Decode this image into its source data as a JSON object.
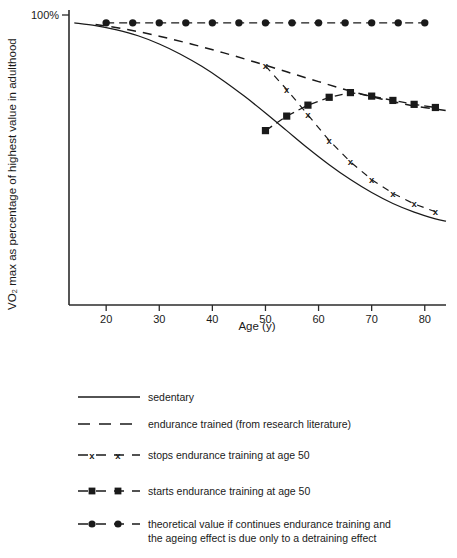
{
  "chart_data": {
    "type": "line",
    "title": "",
    "xlabel": "Age (y)",
    "ylabel": "VO₂ max as percentage of highest value in adulthood",
    "y_top_label": "100%",
    "xlim": [
      13,
      84
    ],
    "ylim": [
      28,
      102
    ],
    "grid": false,
    "legend_position": "below-plot",
    "x_ticks": [
      "20",
      "30",
      "40",
      "50",
      "60",
      "70",
      "80"
    ],
    "x_tick_values": [
      20,
      30,
      40,
      50,
      60,
      70,
      80
    ],
    "y_ticks": [
      "100%"
    ],
    "y_tick_values": [
      100
    ],
    "series": [
      {
        "name": "sedentary",
        "style": "solid",
        "marker": "none",
        "x": [
          14,
          18,
          22,
          26,
          30,
          34,
          38,
          42,
          46,
          50,
          54,
          58,
          62,
          66,
          70,
          74,
          78,
          82,
          84
        ],
        "values": [
          100,
          99.3,
          98.2,
          96.7,
          94.6,
          92.0,
          88.9,
          85.3,
          81.3,
          77.0,
          72.5,
          68.0,
          63.8,
          60.0,
          56.7,
          53.9,
          51.7,
          50.0,
          49.4
        ]
      },
      {
        "name": "endurance trained (from research literature)",
        "style": "dashed",
        "marker": "none",
        "x": [
          18,
          24,
          30,
          36,
          42,
          48,
          54,
          60,
          66,
          72,
          78,
          84
        ],
        "values": [
          99.6,
          98.3,
          96.6,
          94.6,
          92.4,
          90.0,
          87.5,
          85.0,
          82.6,
          80.5,
          78.8,
          77.6
        ]
      },
      {
        "name": "stops endurance training at age 50",
        "style": "dashed",
        "marker": "x",
        "x": [
          50,
          54,
          58,
          62,
          66,
          70,
          74,
          78,
          82
        ],
        "values": [
          89.0,
          83.0,
          76.5,
          70.0,
          64.5,
          60.0,
          56.5,
          53.8,
          51.8
        ]
      },
      {
        "name": "starts endurance training at age 50",
        "style": "dashed",
        "marker": "square",
        "x": [
          50,
          54,
          58,
          62,
          66,
          70,
          74,
          78,
          82
        ],
        "values": [
          72.5,
          76.2,
          79.0,
          81.0,
          82.2,
          81.3,
          80.2,
          79.2,
          78.4
        ]
      },
      {
        "name": "theoretical value if continues endurance training and the ageing effect is due only to a detraining effect",
        "style": "dashed",
        "marker": "circle",
        "x": [
          20,
          25,
          30,
          35,
          40,
          45,
          50,
          55,
          60,
          65,
          70,
          75,
          80
        ],
        "values": [
          100,
          100,
          100,
          100,
          100,
          100,
          100,
          100,
          100,
          100,
          100,
          100,
          100
        ]
      }
    ]
  },
  "legend": {
    "items": [
      {
        "label": "sedentary",
        "style": "solid",
        "marker": "none"
      },
      {
        "label": "endurance trained (from research literature)",
        "style": "dashed",
        "marker": "none"
      },
      {
        "label": "stops endurance training at age 50",
        "style": "dashed",
        "marker": "x"
      },
      {
        "label": "starts endurance training at age 50",
        "style": "dashed",
        "marker": "square"
      },
      {
        "label": "theoretical value if continues endurance training and",
        "label2": "the ageing effect is due only to a detraining effect",
        "style": "dashed",
        "marker": "circle"
      }
    ]
  },
  "colors": {
    "ink": "#1a1a1a",
    "axis": "#2b2b2b",
    "background": "#ffffff"
  }
}
